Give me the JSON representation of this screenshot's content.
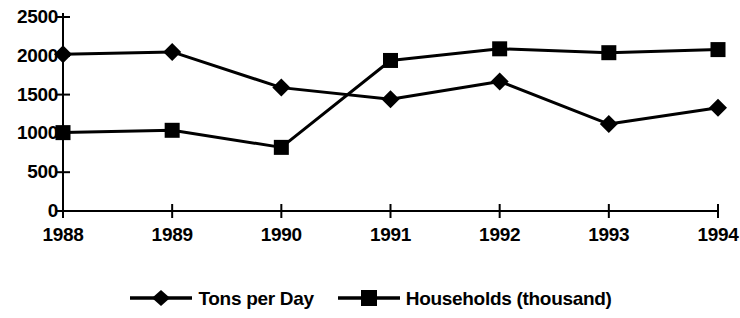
{
  "chart_data": {
    "type": "line",
    "title": "",
    "subtitle": "",
    "xlabel": "",
    "ylabel": "",
    "categories": [
      "1988",
      "1989",
      "1990",
      "1991",
      "1992",
      "1993",
      "1994"
    ],
    "series": [
      {
        "name": "Tons per Day",
        "marker": "diamond",
        "color": "#000000",
        "values": [
          2020,
          2050,
          1590,
          1440,
          1670,
          1120,
          1330
        ]
      },
      {
        "name": "Households (thousand)",
        "marker": "square",
        "color": "#000000",
        "values": [
          1010,
          1040,
          820,
          1940,
          2090,
          2040,
          2080
        ]
      }
    ],
    "ylim": [
      0,
      2500
    ],
    "yticks": [
      0,
      500,
      1000,
      1500,
      2000,
      2500
    ],
    "ytick_labels": [
      "0",
      "500",
      "1000",
      "1500",
      "2000",
      "2500"
    ],
    "xtick_labels": [
      "1988",
      "1989",
      "1990",
      "1991",
      "1992",
      "1993",
      "1994"
    ],
    "grid": false,
    "legend_position": "bottom"
  },
  "legend": {
    "entries": [
      {
        "label": "Tons per Day",
        "marker": "diamond"
      },
      {
        "label": "Households (thousand)",
        "marker": "square"
      }
    ]
  },
  "axis": {
    "y_labels": [
      "2500",
      "2000",
      "1500",
      "1000",
      "500",
      "0"
    ],
    "x_labels": [
      "1988",
      "1989",
      "1990",
      "1991",
      "1992",
      "1993",
      "1994"
    ]
  }
}
